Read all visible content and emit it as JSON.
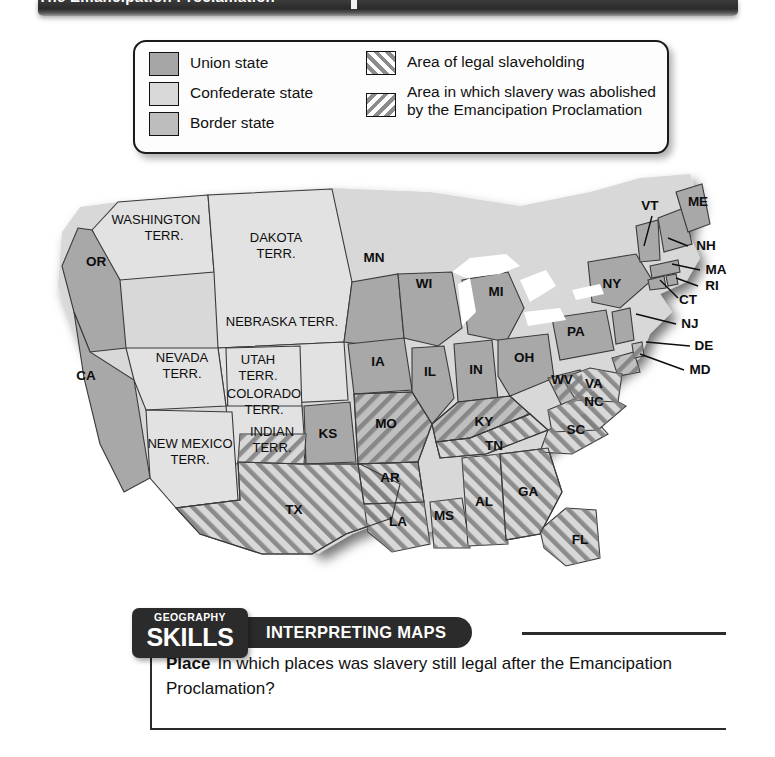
{
  "header": {
    "title": "The Emancipation Proclamation",
    "bar_color": "#2a2a2a"
  },
  "legend": {
    "title": "Legend",
    "items": [
      {
        "id": "union-state",
        "label": "Union state",
        "swatch": "solid-fill",
        "color": "#a6a6a6"
      },
      {
        "id": "confederate-state",
        "label": "Confederate state",
        "swatch": "solid-fill",
        "color": "#d9d9d9"
      },
      {
        "id": "border-state",
        "label": "Border state",
        "swatch": "solid-fill",
        "color": "#bdbdbd"
      },
      {
        "id": "legal-slaveholding",
        "label": "Area of legal slaveholding",
        "swatch": "forward-hatch",
        "color": "#8c8c8c"
      },
      {
        "id": "abolished-by-ep",
        "label": "Area in which slavery was abolished by the Emancipation Proclamation",
        "swatch": "backward-hatch",
        "color": "#8c8c8c"
      }
    ]
  },
  "map": {
    "name": "united-states-1863-slavery-map",
    "labels": {
      "washington_terr": "WASHINGTON\nTERR.",
      "washington_l1": "WASHINGTON",
      "washington_l2": "TERR.",
      "dakota_l1": "DAKOTA",
      "dakota_l2": "TERR.",
      "nebraska": "NEBRASKA TERR.",
      "nevada_l1": "NEVADA",
      "nevada_l2": "TERR.",
      "utah_l1": "UTAH",
      "utah_l2": "TERR.",
      "colorado_l1": "COLORADO",
      "colorado_l2": "TERR.",
      "newmexico_l1": "NEW MEXICO",
      "newmexico_l2": "TERR.",
      "indian_l1": "INDIAN",
      "indian_l2": "TERR.",
      "or": "OR",
      "ca": "CA",
      "mn": "MN",
      "wi": "WI",
      "mi": "MI",
      "ia": "IA",
      "il": "IL",
      "in": "IN",
      "oh": "OH",
      "ks": "KS",
      "mo": "MO",
      "ky": "KY",
      "tn": "TN",
      "ar": "AR",
      "ms": "MS",
      "al": "AL",
      "ga": "GA",
      "la": "LA",
      "tx": "TX",
      "fl": "FL",
      "sc": "SC",
      "nc": "NC",
      "va": "VA",
      "wv": "WV",
      "md": "MD",
      "de": "DE",
      "nj": "NJ",
      "pa": "PA",
      "ny": "NY",
      "ct": "CT",
      "ri": "RI",
      "ma": "MA",
      "vt": "VT",
      "nh": "NH",
      "me": "ME"
    }
  },
  "skills": {
    "badge_line1": "GEOGRAPHY",
    "badge_line2": "SKILLS",
    "banner": "INTERPRETING MAPS",
    "question_label": "Place",
    "question_text": "In which places was slavery still legal after the Emancipation Proclamation?"
  }
}
